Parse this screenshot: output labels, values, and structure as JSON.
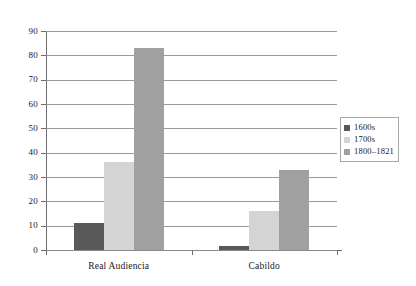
{
  "chart_data": {
    "type": "bar",
    "title": "",
    "xlabel": "",
    "ylabel": "",
    "categories": [
      "Real Audiencia",
      "Cabildo"
    ],
    "series": [
      {
        "name": "1600s",
        "values": [
          11,
          1.5
        ],
        "color": "#595959"
      },
      {
        "name": "1700s",
        "values": [
          36,
          16
        ],
        "color": "#d4d4d4"
      },
      {
        "name": "1800–1821",
        "values": [
          83,
          33
        ],
        "color": "#a0a0a0"
      }
    ],
    "ylim": [
      0,
      90
    ],
    "y_ticks": [
      0,
      10,
      20,
      30,
      40,
      50,
      60,
      70,
      80,
      90
    ],
    "y_tick_labels": [
      "0",
      "10",
      "20",
      "30",
      "40",
      "50",
      "60",
      "70",
      "80",
      "90"
    ],
    "grid": true,
    "grid_axis": "y",
    "legend_position": "right",
    "legend_entries": [
      "1600s",
      "1700s",
      "1800–1821"
    ]
  },
  "axis": {
    "y_tick_labels": [
      "90",
      "80",
      "70",
      "60",
      "50",
      "40",
      "30",
      "20",
      "10",
      "0"
    ],
    "x_tick_labels": [
      "Real Audiencia",
      "Cabildo"
    ]
  },
  "legend": {
    "items": [
      {
        "label": "1600s"
      },
      {
        "label": "1700s"
      },
      {
        "label": "1800–1821"
      }
    ]
  },
  "colors": {
    "series_1600s": "#595959",
    "series_1700s": "#d4d4d4",
    "series_1800_1821": "#a0a0a0",
    "gridline": "#9a9a9a",
    "axis": "#6e6e6e",
    "background": "#ffffff"
  }
}
